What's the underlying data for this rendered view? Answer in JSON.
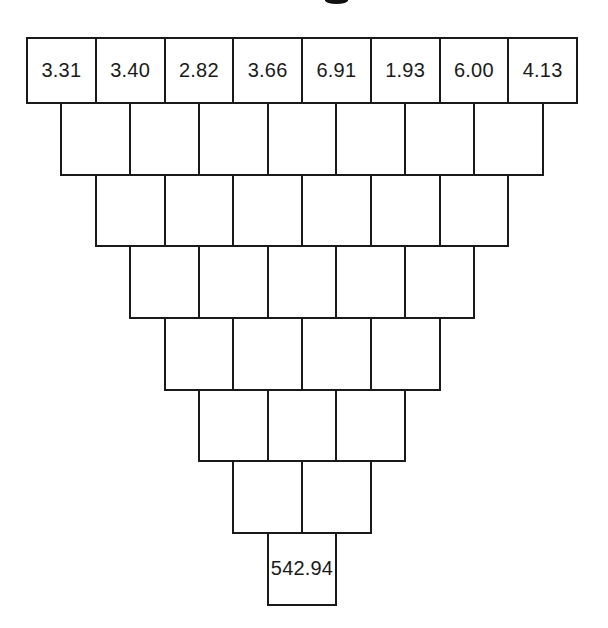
{
  "page": {
    "background": "#ffffff",
    "line_color": "#1a1a1a",
    "text_color": "#1a1a1a"
  },
  "clipped_title": {
    "visible_glyph_fragment": "g"
  },
  "pyramid": {
    "type": "addition-pyramid",
    "row_count": 8,
    "rows": [
      {
        "cells": [
          "3.31",
          "3.40",
          "2.82",
          "3.66",
          "6.91",
          "1.93",
          "6.00",
          "4.13"
        ]
      },
      {
        "cells": [
          "",
          "",
          "",
          "",
          "",
          "",
          ""
        ]
      },
      {
        "cells": [
          "",
          "",
          "",
          "",
          "",
          ""
        ]
      },
      {
        "cells": [
          "",
          "",
          "",
          "",
          ""
        ]
      },
      {
        "cells": [
          "",
          "",
          "",
          ""
        ]
      },
      {
        "cells": [
          "",
          "",
          ""
        ]
      },
      {
        "cells": [
          "",
          ""
        ]
      },
      {
        "cells": [
          "542.94"
        ]
      }
    ]
  }
}
